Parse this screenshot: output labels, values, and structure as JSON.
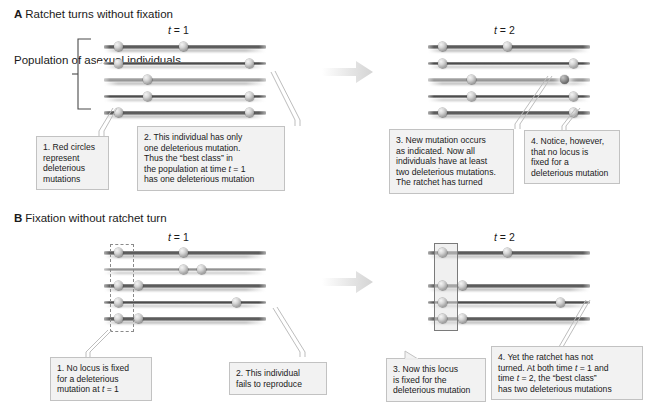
{
  "figure": {
    "panels": [
      {
        "id": "A",
        "letter": "A",
        "title": "Ratchet turns without fixation",
        "timepoints": [
          {
            "id": "t1",
            "label_prefix": "t",
            "label": "t = 1"
          },
          {
            "id": "t2",
            "label_prefix": "t",
            "label": "t = 2"
          }
        ],
        "bracket_label_lines": [
          "Population",
          "of asexual",
          "individuals"
        ],
        "callouts": [
          {
            "id": "a1",
            "number": "1.",
            "lines": [
              "1. Red circles",
              "represent",
              "deleterious",
              "mutations"
            ]
          },
          {
            "id": "a2",
            "number": "2.",
            "lines": [
              "2. This individual has only",
              "one deleterious mutation.",
              "Thus the “best class” in",
              "the population at time t = 1",
              "has one deleterious mutation"
            ]
          },
          {
            "id": "a3",
            "number": "3.",
            "lines": [
              "3. New mutation occurs",
              "as indicated. Now all",
              "individuals have at least",
              "two deleterious mutations.",
              "The ratchet has turned"
            ]
          },
          {
            "id": "a4",
            "number": "4.",
            "lines": [
              "4. Notice, however,",
              "that no locus is",
              "fixed for a",
              "deleterious mutation"
            ]
          }
        ]
      },
      {
        "id": "B",
        "letter": "B",
        "title": "Fixation without ratchet turn",
        "timepoints": [
          {
            "id": "t1",
            "label_prefix": "t",
            "label": "t = 1"
          },
          {
            "id": "t2",
            "label_prefix": "t",
            "label": "t = 2"
          }
        ],
        "callouts": [
          {
            "id": "b1",
            "number": "1.",
            "lines": [
              "1. No locus is fixed",
              "for a deleterious",
              "mutation at t = 1"
            ]
          },
          {
            "id": "b2",
            "number": "2.",
            "lines": [
              "2. This individual",
              "fails to reproduce"
            ]
          },
          {
            "id": "b3",
            "number": "3.",
            "lines": [
              "3. Now this locus",
              "is fixed for the",
              "deleterious mutation"
            ]
          },
          {
            "id": "b4",
            "number": "4.",
            "lines": [
              "4. Yet the ratchet has not",
              "turned. At both time t = 1 and",
              "time t = 2, the “best class”",
              "has two deleterious mutations"
            ]
          }
        ]
      }
    ]
  },
  "chart_data": {
    "type": "diagram",
    "legend": "Circles represent deleterious mutations on chromosomes of asexual individuals",
    "panels": [
      {
        "panel": "A",
        "panel_title": "Ratchet turns without fixation",
        "timepoints": [
          {
            "time": "t = 1",
            "individuals": [
              {
                "row": 1,
                "shade": "dark",
                "mutation_loci": [
                  0.09,
                  0.49
                ],
                "mutation_count": 2
              },
              {
                "row": 2,
                "shade": "dark",
                "mutation_loci": [
                  0.09,
                  0.9
                ],
                "mutation_count": 2
              },
              {
                "row": 3,
                "shade": "light",
                "mutation_loci": [
                  0.27
                ],
                "mutation_count": 1
              },
              {
                "row": 4,
                "shade": "dark",
                "mutation_loci": [
                  0.27,
                  0.9
                ],
                "mutation_count": 2
              },
              {
                "row": 5,
                "shade": "dark",
                "mutation_loci": [
                  0.09,
                  0.9
                ],
                "mutation_count": 2
              }
            ],
            "best_class_mutations": 1
          },
          {
            "time": "t = 2",
            "individuals": [
              {
                "row": 1,
                "shade": "dark",
                "mutation_loci": [
                  0.09,
                  0.49
                ],
                "mutation_count": 2,
                "new_mutation_loci": []
              },
              {
                "row": 2,
                "shade": "dark",
                "mutation_loci": [
                  0.09,
                  0.9
                ],
                "mutation_count": 2,
                "new_mutation_loci": []
              },
              {
                "row": 3,
                "shade": "light",
                "mutation_loci": [
                  0.27,
                  0.84
                ],
                "mutation_count": 2,
                "new_mutation_loci": [
                  0.84
                ]
              },
              {
                "row": 4,
                "shade": "dark",
                "mutation_loci": [
                  0.27,
                  0.9
                ],
                "mutation_count": 2,
                "new_mutation_loci": []
              },
              {
                "row": 5,
                "shade": "dark",
                "mutation_loci": [
                  0.09,
                  0.9
                ],
                "mutation_count": 2,
                "new_mutation_loci": []
              }
            ],
            "best_class_mutations": 2,
            "ratchet_turned": true,
            "locus_fixed": false
          }
        ]
      },
      {
        "panel": "B",
        "panel_title": "Fixation without ratchet turn",
        "timepoints": [
          {
            "time": "t = 1",
            "highlight_locus": 0.09,
            "highlight_style": "dashed",
            "individuals": [
              {
                "row": 1,
                "shade": "dark",
                "mutation_loci": [
                  0.09,
                  0.49
                ],
                "mutation_count": 2
              },
              {
                "row": 2,
                "shade": "light",
                "mutation_loci": [
                  0.49,
                  0.6
                ],
                "mutation_count": 2
              },
              {
                "row": 3,
                "shade": "dark",
                "mutation_loci": [
                  0.09,
                  0.21
                ],
                "mutation_count": 2
              },
              {
                "row": 4,
                "shade": "dark",
                "mutation_loci": [
                  0.09,
                  0.82
                ],
                "mutation_count": 2
              },
              {
                "row": 5,
                "shade": "dark",
                "mutation_loci": [
                  0.09,
                  0.21
                ],
                "mutation_count": 2
              }
            ],
            "locus_fixed": false,
            "best_class_mutations": 2
          },
          {
            "time": "t = 2",
            "highlight_locus": 0.09,
            "highlight_style": "solid",
            "individuals": [
              {
                "row": 1,
                "shade": "dark",
                "mutation_loci": [
                  0.09,
                  0.49
                ],
                "mutation_count": 2
              },
              {
                "row": 2,
                "shade": "dark",
                "mutation_loci": [
                  0.09,
                  0.21
                ],
                "mutation_count": 2
              },
              {
                "row": 3,
                "shade": "dark",
                "mutation_loci": [
                  0.09,
                  0.82
                ],
                "mutation_count": 2
              },
              {
                "row": 4,
                "shade": "dark",
                "mutation_loci": [
                  0.09,
                  0.21
                ],
                "mutation_count": 2
              }
            ],
            "locus_fixed": true,
            "ratchet_turned": false,
            "best_class_mutations": 2
          }
        ]
      }
    ]
  },
  "colors": {
    "callout_fill": "#f2f2f2",
    "callout_border": "#c2c2c2",
    "chromosome_dark": "#4a4a4a",
    "chromosome_light": "#9a9a9a",
    "mutation_circle": "#d6d6d6",
    "new_mutation_circle": "#6f6f6f",
    "arrow": "#e2e2e2",
    "text": "#1a1a1a"
  }
}
